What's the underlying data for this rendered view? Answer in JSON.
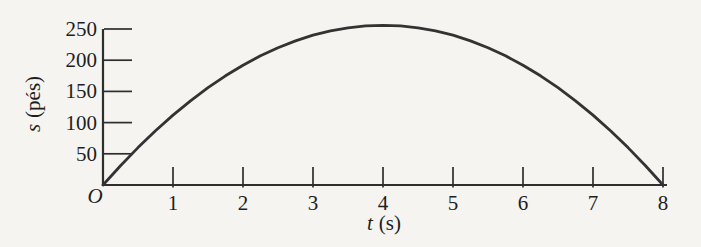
{
  "colors": {
    "background": "#f5f4f0",
    "ink": "#2e2e2e",
    "text": "#1e1e1e"
  },
  "chart_data": {
    "type": "line",
    "title": "",
    "xlabel": "t (s)",
    "ylabel": "s (pés)",
    "xlabel_var": "t",
    "xlabel_unit": "(s)",
    "ylabel_var": "s",
    "ylabel_unit": "(pés)",
    "origin_label": "O",
    "xlim": [
      0,
      8
    ],
    "ylim": [
      0,
      258
    ],
    "x_ticks": [
      1,
      2,
      3,
      4,
      5,
      6,
      7,
      8
    ],
    "y_ticks": [
      50,
      100,
      150,
      200,
      250
    ],
    "grid": false,
    "legend": false,
    "x": [
      0,
      0.25,
      0.5,
      0.75,
      1,
      1.25,
      1.5,
      1.75,
      2,
      2.25,
      2.5,
      2.75,
      3,
      3.25,
      3.5,
      3.75,
      4,
      4.25,
      4.5,
      4.75,
      5,
      5.25,
      5.5,
      5.75,
      6,
      6.25,
      6.5,
      6.75,
      7,
      7.25,
      7.5,
      7.75,
      8
    ],
    "series": [
      {
        "name": "s(t)",
        "values": [
          0,
          31,
          60,
          87,
          112,
          135,
          156,
          175,
          192,
          207,
          220,
          231,
          240,
          247,
          252,
          255,
          256,
          255,
          252,
          247,
          240,
          231,
          220,
          207,
          192,
          175,
          156,
          135,
          112,
          87,
          60,
          31,
          0
        ]
      }
    ],
    "peak": {
      "t": 4,
      "s": 256
    }
  }
}
